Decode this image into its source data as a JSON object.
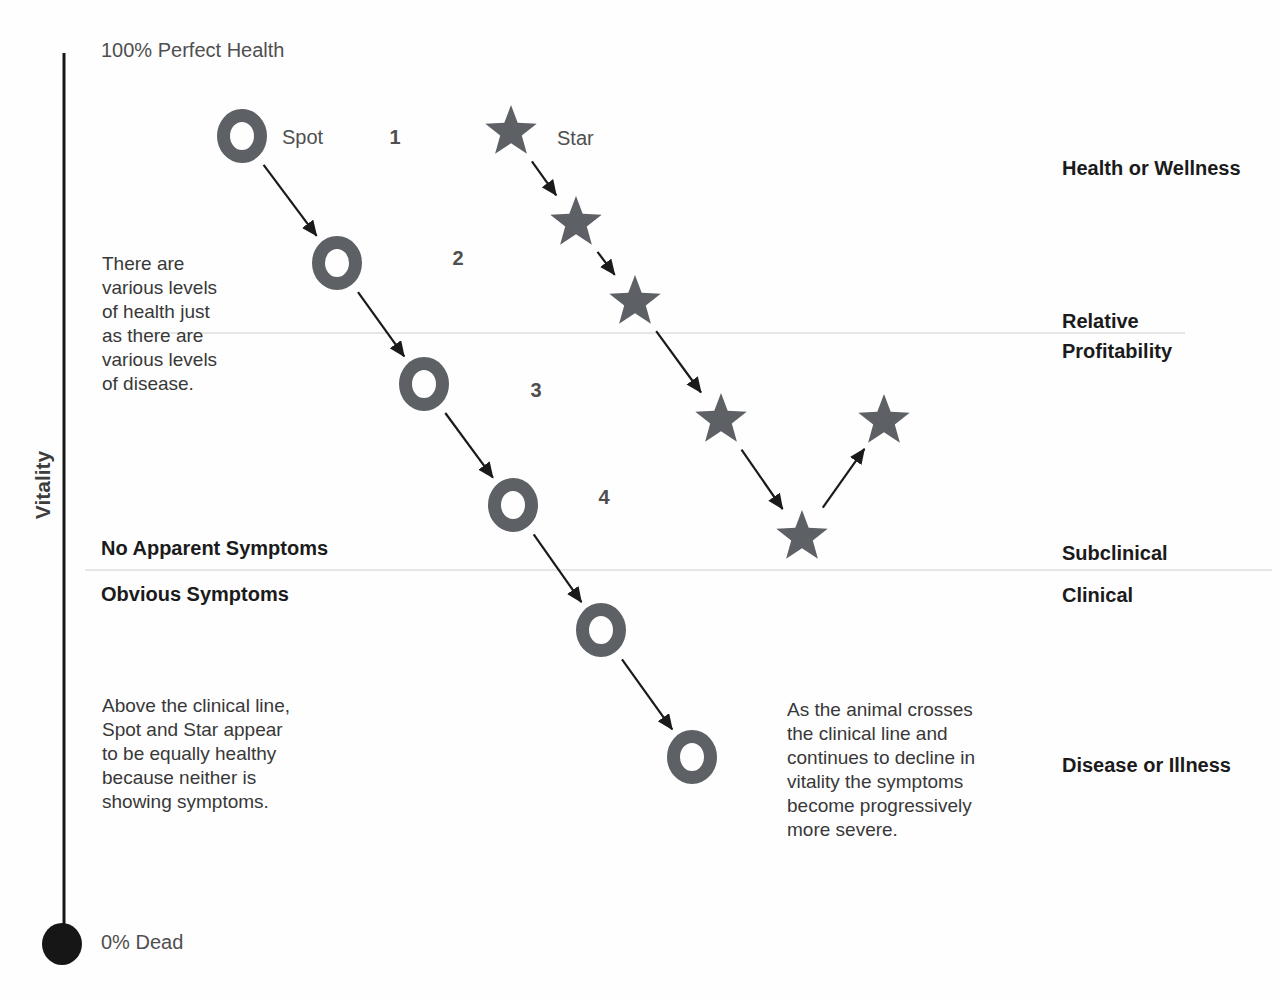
{
  "colors": {
    "marker": "#5d6064",
    "arrow": "#1a1a1a",
    "axis": "#161616",
    "faint_line": "#e6e6e6"
  },
  "axis": {
    "label": "Vitality",
    "top_label": "100% Perfect Health",
    "bottom_label": "0% Dead",
    "line": {
      "x": 64,
      "y1": 53,
      "y2": 924
    },
    "dot": {
      "cx": 62,
      "cy": 944,
      "rx": 20,
      "ry": 21
    }
  },
  "series": [
    {
      "id": "spot",
      "label": "Spot",
      "marker": "ring",
      "points": [
        [
          242,
          136
        ],
        [
          337,
          263
        ],
        [
          424,
          384
        ],
        [
          513,
          505
        ],
        [
          601,
          630
        ],
        [
          692,
          757
        ]
      ]
    },
    {
      "id": "star",
      "label": "Star",
      "marker": "star",
      "points": [
        [
          511,
          132
        ],
        [
          576,
          223
        ],
        [
          635,
          302
        ],
        [
          721,
          420
        ],
        [
          802,
          537
        ],
        [
          884,
          421
        ]
      ]
    }
  ],
  "stage_numbers": [
    {
      "label": "1",
      "x": 395,
      "y": 137
    },
    {
      "label": "2",
      "x": 458,
      "y": 258
    },
    {
      "label": "3",
      "x": 536,
      "y": 390
    },
    {
      "label": "4",
      "x": 604,
      "y": 497
    }
  ],
  "zone_lines": [
    {
      "y": 333,
      "x1": 140,
      "x2": 1185
    },
    {
      "y": 570,
      "x1": 85,
      "x2": 1272
    }
  ],
  "left_labels": {
    "no_apparent": "No Apparent Symptoms",
    "obvious": "Obvious Symptoms"
  },
  "right_labels": {
    "health": "Health or Wellness",
    "relative_profitability": "Relative\nProfitability",
    "subclinical": "Subclinical",
    "clinical": "Clinical",
    "disease": "Disease or Illness"
  },
  "annotations": {
    "levels": "There are\nvarious levels\nof health just\nas there are\nvarious levels\nof disease.",
    "above_line": "Above the clinical line,\nSpot and Star appear\nto be equally healthy\nbecause neither is\nshowing symptoms.",
    "crossing": "As the animal crosses\nthe clinical line and\ncontinues to decline in\nvitality the symptoms\nbecome progressively\nmore severe."
  }
}
